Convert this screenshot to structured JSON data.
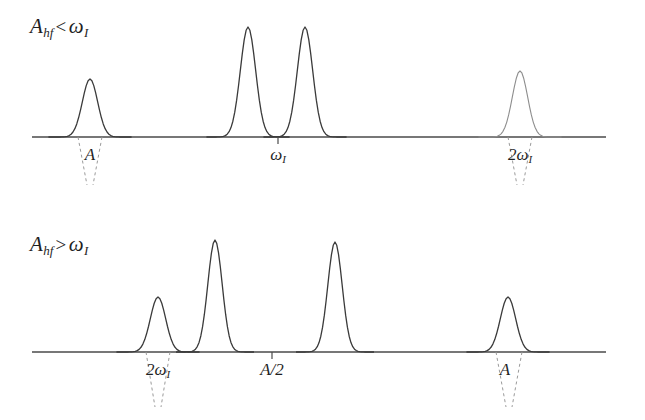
{
  "figure": {
    "background_color": "#ffffff",
    "trace_color": "#3a3a3a",
    "baseline_color": "#4a4a4a",
    "guide_color": "#9a9a9a",
    "width": 645,
    "height": 420
  },
  "panels": [
    {
      "id": "panel-upper",
      "condition_label": {
        "symbol": "A",
        "subscript": "hf",
        "relation": "<",
        "compared_to": "ω",
        "compared_subscript": "I",
        "full_text": "A_hf < ω_I"
      },
      "label_x": 30,
      "label_y": 14,
      "baseline_y": 137,
      "baseline_x_start": 32,
      "baseline_x_end": 606,
      "peaks": [
        {
          "name": "peak-1",
          "x": 90,
          "height": 58,
          "width": 16,
          "style": "solid"
        },
        {
          "name": "peak-2",
          "x": 248,
          "height": 110,
          "width": 16,
          "style": "solid"
        },
        {
          "name": "peak-3",
          "x": 305,
          "height": 110,
          "width": 16,
          "style": "solid"
        },
        {
          "name": "peak-4",
          "x": 520,
          "height": 66,
          "width": 16,
          "style": "light"
        }
      ],
      "ticks": [
        {
          "name": "tick-omega-I",
          "x": 278
        }
      ],
      "annotations": [
        {
          "name": "annotation-A",
          "text": "A",
          "display": "A",
          "subscript": "",
          "x": 90,
          "y": 145,
          "span_from": 78,
          "span_to": 102,
          "converge_to": 90,
          "converge_depth": 48,
          "guide": "converging-dashed"
        },
        {
          "name": "annotation-omega-I",
          "text": "ω_I",
          "display": "ω",
          "subscript": "I",
          "x": 278,
          "y": 145,
          "guide": "tick-only"
        },
        {
          "name": "annotation-2-omega-I",
          "text": "2ω_I",
          "display": "2ω",
          "subscript": "I",
          "x": 520,
          "y": 145,
          "span_from": 508,
          "span_to": 532,
          "converge_to": 520,
          "converge_depth": 48,
          "guide": "converging-dashed"
        }
      ]
    },
    {
      "id": "panel-lower",
      "condition_label": {
        "symbol": "A",
        "subscript": "hf",
        "relation": ">",
        "compared_to": "ω",
        "compared_subscript": "I",
        "full_text": "A_hf > ω_I"
      },
      "label_x": 30,
      "label_y": 232,
      "baseline_y": 352,
      "baseline_x_start": 32,
      "baseline_x_end": 606,
      "peaks": [
        {
          "name": "peak-1",
          "x": 158,
          "height": 55,
          "width": 16,
          "style": "solid"
        },
        {
          "name": "peak-2",
          "x": 215,
          "height": 112,
          "width": 15,
          "style": "solid"
        },
        {
          "name": "peak-3",
          "x": 335,
          "height": 110,
          "width": 15,
          "style": "solid"
        },
        {
          "name": "peak-4",
          "x": 508,
          "height": 55,
          "width": 16,
          "style": "solid"
        }
      ],
      "ticks": [
        {
          "name": "tick-A-over-2",
          "x": 272
        }
      ],
      "annotations": [
        {
          "name": "annotation-2-omega-I",
          "text": "2ω_I",
          "display": "2ω",
          "subscript": "I",
          "x": 158,
          "y": 360,
          "span_from": 146,
          "span_to": 170,
          "converge_to": 158,
          "converge_depth": 55,
          "guide": "converging-dashed"
        },
        {
          "name": "annotation-A-over-2",
          "text": "A/2",
          "display": "A/2",
          "subscript": "",
          "x": 272,
          "y": 360,
          "guide": "tick-only"
        },
        {
          "name": "annotation-A",
          "text": "A",
          "display": "A",
          "subscript": "",
          "x": 505,
          "y": 360,
          "span_from": 496,
          "span_to": 522,
          "converge_to": 509,
          "converge_depth": 55,
          "guide": "converging-dashed"
        }
      ]
    }
  ],
  "chart_data": {
    "type": "line",
    "title": "",
    "subtitle": "",
    "xlabel": "",
    "ylabel": "",
    "grid": false,
    "legend_position": "none",
    "charts": [
      {
        "name": "A_hf < ω_I",
        "x": [
          90,
          248,
          305,
          520
        ],
        "values": [
          58,
          110,
          110,
          66
        ],
        "tick_labels": [
          "A",
          "ω_I",
          "2ω_I"
        ],
        "tick_x": [
          90,
          278,
          520
        ],
        "ylim": [
          0,
          125
        ],
        "xlim": [
          32,
          606
        ]
      },
      {
        "name": "A_hf > ω_I",
        "x": [
          158,
          215,
          335,
          508
        ],
        "values": [
          55,
          112,
          110,
          55
        ],
        "tick_labels": [
          "2ω_I",
          "A/2",
          "A"
        ],
        "tick_x": [
          158,
          272,
          508
        ],
        "ylim": [
          0,
          125
        ],
        "xlim": [
          32,
          606
        ]
      }
    ]
  }
}
